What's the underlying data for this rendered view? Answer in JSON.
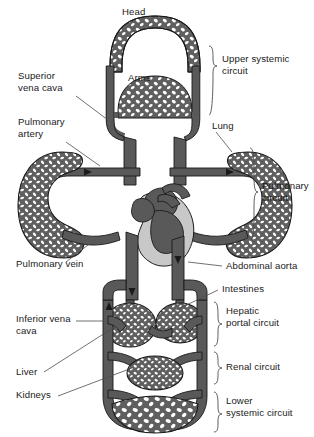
{
  "diagram": {
    "colors": {
      "vessel": "#595959",
      "vessel_outline": "#1a1a1a",
      "ventricle_light": "#c8c8c8",
      "capillary_fill": "#6b6b6b",
      "background": "#ffffff",
      "label_text": "#1a1a1a",
      "leader_line": "#4d4d4d"
    },
    "labels": {
      "head": "Head",
      "arms": "Arms",
      "superior_vena_cava": "Superior\nvena cava",
      "pulmonary_artery": "Pulmonary\nartery",
      "pulmonary_vein": "Pulmonary vein",
      "lung": "Lung",
      "abdominal_aorta": "Abdominal aorta",
      "intestines": "Intestines",
      "inferior_vena_cava": "Inferior vena\ncava",
      "liver": "Liver",
      "kidneys": "Kidneys"
    },
    "brackets": {
      "upper_systemic": "Upper systemic\ncircuit",
      "pulmonary": "Pulmonary\ncircuit",
      "hepatic_portal": "Hepatic\nportal circuit",
      "renal": "Renal circuit",
      "lower_systemic": "Lower\nsystemic circuit"
    },
    "organs": [
      {
        "name": "head",
        "region": "upper-systemic"
      },
      {
        "name": "arms",
        "region": "upper-systemic"
      },
      {
        "name": "lung-left",
        "region": "pulmonary"
      },
      {
        "name": "lung-right",
        "region": "pulmonary"
      },
      {
        "name": "heart",
        "region": "central"
      },
      {
        "name": "liver",
        "region": "hepatic-portal"
      },
      {
        "name": "intestines",
        "region": "hepatic-portal"
      },
      {
        "name": "kidneys",
        "region": "renal"
      },
      {
        "name": "lower-body",
        "region": "lower-systemic"
      }
    ]
  }
}
